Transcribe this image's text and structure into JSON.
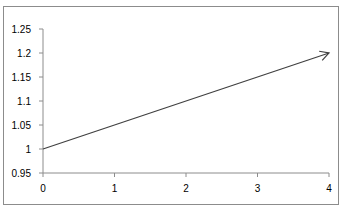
{
  "chart_data": {
    "type": "line",
    "title": "",
    "xlabel": "",
    "ylabel": "",
    "x": [
      0,
      4
    ],
    "series": [
      {
        "name": "arrow",
        "values": [
          1.0,
          1.2
        ],
        "end_marker": "arrow",
        "color": "#404040"
      }
    ],
    "xlim": [
      0,
      4
    ],
    "ylim": [
      0.95,
      1.25
    ],
    "x_ticks": [
      "0",
      "1",
      "2",
      "3",
      "4"
    ],
    "y_ticks": [
      "0.95",
      "1",
      "1.05",
      "1.1",
      "1.15",
      "1.2",
      "1.25"
    ],
    "grid": false,
    "legend": null
  },
  "colors": {
    "axis": "#8c8c8c",
    "line": "#404040",
    "frame": "#8c8c8c"
  }
}
